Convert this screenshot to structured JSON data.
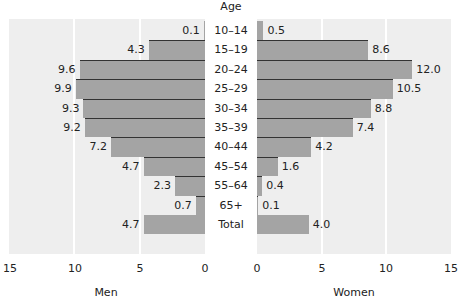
{
  "chart_data": {
    "type": "bar",
    "subtype": "population-pyramid",
    "title": "",
    "center_label": "Age",
    "categories": [
      "10–14",
      "15–19",
      "20–24",
      "25–29",
      "30–34",
      "35–39",
      "40–44",
      "45–54",
      "55–64",
      "65+",
      "Total"
    ],
    "series": [
      {
        "name": "Men",
        "side": "left",
        "values": [
          0.1,
          4.3,
          9.6,
          9.9,
          9.3,
          9.2,
          7.2,
          4.7,
          2.3,
          0.7,
          4.7
        ]
      },
      {
        "name": "Women",
        "side": "right",
        "values": [
          0.5,
          8.6,
          12.0,
          10.5,
          8.8,
          7.4,
          4.2,
          1.6,
          0.4,
          0.1,
          4.0
        ]
      }
    ],
    "value_labels": {
      "men": [
        "0.1",
        "4.3",
        "9.6",
        "9.9",
        "9.3",
        "9.2",
        "7.2",
        "4.7",
        "2.3",
        "0.7",
        "4.7"
      ],
      "women": [
        "0.5",
        "8.6",
        "12.0",
        "10.5",
        "8.8",
        "7.4",
        "4.2",
        "1.6",
        "0.4",
        "0.1",
        "4.0"
      ]
    },
    "xlim": [
      0,
      15
    ],
    "xticks_left": [
      "15",
      "10",
      "5",
      "0"
    ],
    "xticks_right": [
      "0",
      "5",
      "10",
      "15"
    ],
    "xlabel_left": "Men",
    "xlabel_right": "Women",
    "grid": true,
    "legend": "none"
  },
  "colors": {
    "bar": "#a4a4a4",
    "separator": "#333333",
    "plot_background": "#eeeeee",
    "gridline": "#ffffff"
  }
}
